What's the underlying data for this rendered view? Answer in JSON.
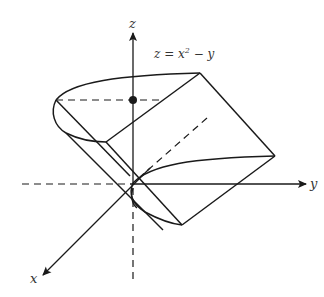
{
  "diagram": {
    "type": "3d-surface-sketch",
    "equation": {
      "lhs": "z = x",
      "exponent": "2",
      "rhs": " − y",
      "full": "z = x² − y"
    },
    "axes": {
      "x_label": "x",
      "y_label": "y",
      "z_label": "z"
    },
    "colors": {
      "stroke": "#1a1a1a",
      "text": "#333333",
      "background": "#ffffff"
    }
  }
}
